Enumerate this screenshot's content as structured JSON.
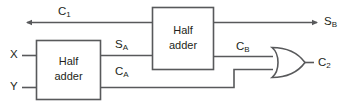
{
  "diagram": {
    "type": "logic-circuit",
    "background_color": "#ffffff",
    "wire_color": "#58595b",
    "text_color": "#231f20",
    "blocks": [
      {
        "id": "half-adder-a",
        "label_line1": "Half",
        "label_line2": "adder",
        "x": 36,
        "y": 40,
        "width": 65,
        "height": 60
      },
      {
        "id": "half-adder-b",
        "label_line1": "Half",
        "label_line2": "adder",
        "x": 152,
        "y": 7,
        "width": 62,
        "height": 63
      }
    ],
    "gates": [
      {
        "id": "or-gate",
        "kind": "or-gate",
        "label": "OR",
        "x": 272,
        "y": 47,
        "width": 33,
        "height": 31
      }
    ],
    "signals": [
      {
        "id": "c1",
        "base": "C",
        "sub": "1",
        "x": 58,
        "y": 12
      },
      {
        "id": "x",
        "base": "X",
        "sub": "",
        "x": 10,
        "y": 55
      },
      {
        "id": "y",
        "base": "Y",
        "sub": "",
        "x": 10,
        "y": 87
      },
      {
        "id": "sa",
        "base": "S",
        "sub": "A",
        "x": 115,
        "y": 45
      },
      {
        "id": "ca",
        "base": "C",
        "sub": "A",
        "x": 115,
        "y": 72
      },
      {
        "id": "cb",
        "base": "C",
        "sub": "B",
        "x": 236,
        "y": 47
      },
      {
        "id": "sb",
        "base": "S",
        "sub": "B",
        "x": 324,
        "y": 22
      },
      {
        "id": "c2",
        "base": "C",
        "sub": "2",
        "x": 318,
        "y": 63
      }
    ],
    "nets": [
      {
        "id": "net-c1",
        "from": "carry-in-arrow",
        "to": "half-adder-b-in-top"
      },
      {
        "id": "net-x",
        "from": "input-x",
        "to": "half-adder-a-in-top"
      },
      {
        "id": "net-y",
        "from": "input-y",
        "to": "half-adder-a-in-bottom"
      },
      {
        "id": "net-sa",
        "from": "half-adder-a-sum",
        "to": "half-adder-b-in-bottom"
      },
      {
        "id": "net-ca",
        "from": "half-adder-a-carry",
        "to": "or-gate-in-bottom"
      },
      {
        "id": "net-cb",
        "from": "half-adder-b-carry",
        "to": "or-gate-in-top"
      },
      {
        "id": "net-sb",
        "from": "half-adder-b-sum",
        "to": "output-sb-arrow"
      },
      {
        "id": "net-c2",
        "from": "or-gate-out",
        "to": "output-c2"
      }
    ]
  }
}
